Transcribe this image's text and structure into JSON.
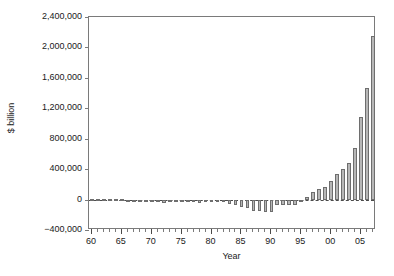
{
  "chart_data": {
    "type": "bar",
    "title": "",
    "xlabel": "Year",
    "ylabel": "$ billion",
    "ylim": [
      -400000,
      2400000
    ],
    "ytick_values": [
      -400000,
      0,
      400000,
      800000,
      1200000,
      1600000,
      2000000,
      2400000
    ],
    "ytick_labels": [
      "−400,000",
      "0",
      "400,000",
      "800,000",
      "1,200,000",
      "1,600,000",
      "2,000,000",
      "2,400,000"
    ],
    "grid": false,
    "legend": null,
    "zero_reference_line": true,
    "zero_reference_line_style": "dashed",
    "bar_fill_color": "#b7b7b7",
    "bar_edge_color": "#6e6e6e",
    "axis_color": "#7a7a7a",
    "xlim": [
      1959.5,
      2007.5
    ],
    "xtick_major_values": [
      1960,
      1965,
      1970,
      1975,
      1980,
      1985,
      1990,
      1995,
      2000,
      2005
    ],
    "xtick_major_labels": [
      "60",
      "65",
      "70",
      "75",
      "80",
      "85",
      "90",
      "95",
      "00",
      "05"
    ],
    "xtick_minor_step": 1,
    "categories": [
      "1960",
      "1961",
      "1962",
      "1963",
      "1964",
      "1965",
      "1966",
      "1967",
      "1968",
      "1969",
      "1970",
      "1971",
      "1972",
      "1973",
      "1974",
      "1975",
      "1976",
      "1977",
      "1978",
      "1979",
      "1980",
      "1981",
      "1982",
      "1983",
      "1984",
      "1985",
      "1986",
      "1987",
      "1988",
      "1989",
      "1990",
      "1991",
      "1992",
      "1993",
      "1994",
      "1995",
      "1996",
      "1997",
      "1998",
      "1999",
      "2000",
      "2001",
      "2002",
      "2003",
      "2004",
      "2005",
      "2006",
      "2007"
    ],
    "values": [
      2000,
      2000,
      1000,
      1000,
      2000,
      1000,
      0,
      -1000,
      -2000,
      -3000,
      -5000,
      -32000,
      -42000,
      -10000,
      -6000,
      -5000,
      -18000,
      -38000,
      -40000,
      -20000,
      -16000,
      -18000,
      -28000,
      -52000,
      -78000,
      -92000,
      -110000,
      -150000,
      -155000,
      -165000,
      -160000,
      -75000,
      -70000,
      -72000,
      -74000,
      -30000,
      30000,
      95000,
      140000,
      160000,
      240000,
      330000,
      400000,
      475000,
      680000,
      1080000,
      1470000,
      2150000
    ]
  },
  "axes": {
    "ylabel": "$ billion",
    "xlabel": "Year"
  }
}
